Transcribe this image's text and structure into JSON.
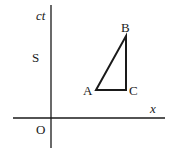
{
  "diagram": {
    "type": "spacetime-diagram",
    "frame_label": "S",
    "origin_label": "O",
    "axes": {
      "vertical": {
        "label": "ct"
      },
      "horizontal": {
        "label": "x"
      }
    },
    "points": [
      {
        "name": "A",
        "label": "A"
      },
      {
        "name": "B",
        "label": "B"
      },
      {
        "name": "C",
        "label": "C"
      }
    ],
    "triangle": [
      "A",
      "B",
      "C"
    ],
    "colors": {
      "line": "#1a1a1a",
      "background": "#ffffff"
    }
  }
}
